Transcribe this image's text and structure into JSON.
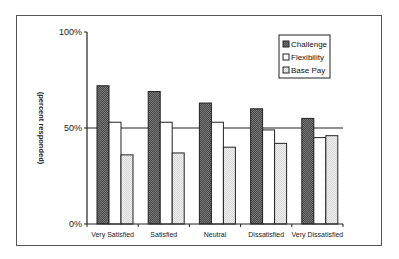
{
  "chart_data": {
    "type": "bar",
    "title": "",
    "xlabel": "",
    "ylabel": "(percent responded)",
    "ylim": [
      0,
      100
    ],
    "yticks": [
      "0%",
      "50%",
      "100%"
    ],
    "reference_line": 50,
    "grid": false,
    "legend_position": "top-right",
    "categories": [
      "Very Satisfied",
      "Satisfied",
      "Neutral",
      "Dissatisfied",
      "Very Dissatisfied"
    ],
    "series": [
      {
        "name": "Challenge",
        "values": [
          72,
          69,
          63,
          60,
          55
        ],
        "fill": "#555555"
      },
      {
        "name": "Flexibility",
        "values": [
          53,
          53,
          53,
          49,
          45
        ],
        "fill": "#ffffff"
      },
      {
        "name": "Base Pay",
        "values": [
          36,
          37,
          40,
          42,
          46
        ],
        "fill": "#e6e6e6"
      }
    ]
  }
}
